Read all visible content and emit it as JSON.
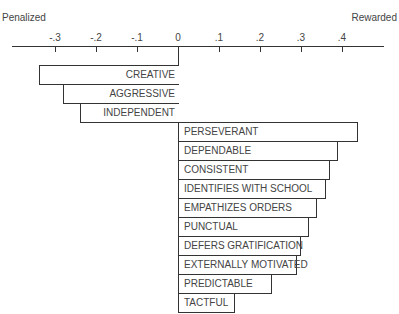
{
  "chart_data": {
    "type": "bar",
    "orientation": "horizontal",
    "title": "",
    "xlabel_left": "Penalized",
    "xlabel_right": "Rewarded",
    "xlim": [
      -0.4,
      0.5
    ],
    "tick_labels": [
      "-.3",
      "-.2",
      "-.1",
      "0",
      ".1",
      ".2",
      ".3",
      ".4"
    ],
    "ticks": [
      -0.3,
      -0.2,
      -0.1,
      0,
      0.1,
      0.2,
      0.3,
      0.4
    ],
    "categories": [
      "CREATIVE",
      "AGGRESSIVE",
      "INDEPENDENT",
      "PERSEVERANT",
      "DEPENDABLE",
      "CONSISTENT",
      "IDENTIFIES WITH SCHOOL",
      "EMPATHIZES ORDERS",
      "PUNCTUAL",
      "DEFERS GRATIFICATION",
      "EXTERNALLY MOTIVATED",
      "PREDICTABLE",
      "TACTFUL"
    ],
    "values": [
      -0.34,
      -0.28,
      -0.24,
      0.44,
      0.39,
      0.37,
      0.36,
      0.34,
      0.32,
      0.3,
      0.29,
      0.23,
      0.14
    ],
    "grid": false,
    "legend": null
  }
}
